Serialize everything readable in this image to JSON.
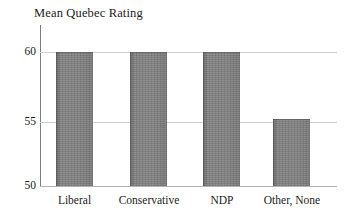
{
  "chart_data": {
    "type": "bar",
    "title": "Mean Quebec Rating",
    "xlabel": "",
    "ylabel": "",
    "categories": [
      "Liberal",
      "Conservative",
      "NDP",
      "Other, None"
    ],
    "values": [
      60,
      60,
      60,
      55
    ],
    "ylim": [
      50,
      60
    ],
    "yticks": [
      "50",
      "55",
      "60"
    ],
    "ytick_values": [
      50,
      55,
      60
    ],
    "grid": "horizontal",
    "legend": "none",
    "series": [
      {
        "name": "Mean Quebec Rating",
        "values": [
          60,
          60,
          60,
          55
        ]
      }
    ],
    "bar_color": "#838383",
    "gridline_color": "#cfcfcf",
    "axis_color": "#7d7d7d",
    "text_color": "#1c1c1c"
  }
}
